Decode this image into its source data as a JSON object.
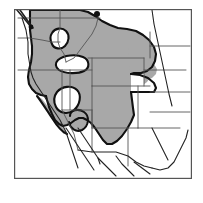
{
  "figure": {
    "type": "range-map",
    "region_label": "Western United States",
    "background_color": "#ffffff",
    "frame": {
      "x": 14,
      "y": 9,
      "width": 178,
      "height": 170,
      "stroke_color": "#555555",
      "stroke_width": 1.2,
      "fill_color": "#ffffff"
    },
    "legend_items": [
      {
        "key": "shaded_range",
        "label": "",
        "color": "#a8a8a8"
      },
      {
        "key": "unshaded_area",
        "label": "",
        "color": "#ffffff"
      },
      {
        "key": "locality_point",
        "label": "",
        "color": "#111111"
      }
    ],
    "colors": {
      "range_fill": "#a8a8a8",
      "range_outline": "#111111",
      "state_border": "#555555",
      "coastline": "#222222",
      "point_marker": "#111111",
      "frame_border": "#555555"
    },
    "style": {
      "range_outline_width": 2.1,
      "state_border_width": 0.9,
      "coastline_width": 1.1
    },
    "shapes": {
      "range_main": "M 36,12 L 46,12 L 56,11 L 70,10 L 86,10 L 96,13 L 104,19 L 112,25 L 122,30 L 134,33 L 146,34 L 152,38 L 154,45 L 152,52 L 148,58 L 152,62 L 157,64 L 160,60 L 163,54 L 165,49 L 163,44 L 160,40 L 158,36 L 156,33 L 151,30 L 146,26 L 140,21 L 134,17 L 128,14 L 122,12 L 116,11 L 110,11 L 104,10 L 98,10 L 90,10 L 82,10 L 74,10 L 66,10 L 58,10 L 50,11 L 42,11 L 36,12 Z",
      "range_body": "M 28,22 L 30,16 L 38,13 L 50,11 L 62,10 L 74,10 L 85,10 L 94,13 L 100,19 L 107,24 L 116,29 L 126,32 L 137,33 L 146,34 L 152,39 L 155,46 L 153,53 L 149,58 L 153,62 L 158,63 L 161,58 L 164,52 L 165,46 L 163,41 L 160,37 L 157,46 L 155,54 L 152,61 L 148,68 L 144,74 L 140,80 L 136,86 L 133,92 L 130,98 L 126,104 L 122,110 L 118,116 L 114,121 L 110,126 L 106,130 L 102,133 L 98,134 L 94,132 L 91,128 L 88,123 L 85,118 L 82,113 L 79,108 L 76,103 L 73,99 L 70,96 L 67,94 L 64,93 L 61,93 L 58,95 L 55,98 L 52,101 L 49,104 L 46,106 L 43,107 L 40,106 L 38,103 L 37,99 L 37,94 L 38,89 L 39,84 L 39,78 L 38,72 L 37,66 L 35,60 L 33,54 L 31,48 L 29,42 L 28,36 L 27,30 L 28,22 Z"
    },
    "points": [
      {
        "name": "locality-point-north",
        "x": 97,
        "y": 14,
        "r": 3.0
      }
    ]
  }
}
